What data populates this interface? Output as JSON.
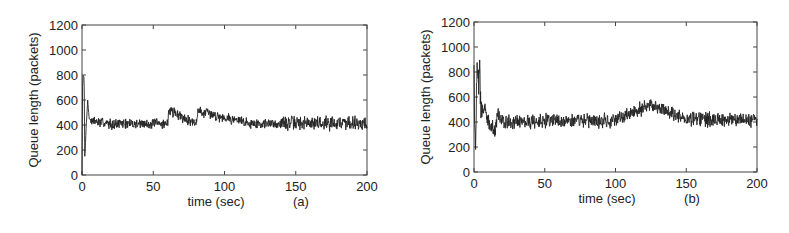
{
  "chart_data": [
    {
      "type": "line",
      "panel_label": "(a)",
      "xlabel": "time (sec)",
      "ylabel": "Queue length (packets)",
      "xlim": [
        0,
        200
      ],
      "ylim": [
        0,
        1200
      ],
      "xticks": [
        0,
        50,
        100,
        150,
        200
      ],
      "yticks": [
        0,
        200,
        400,
        600,
        800,
        1000,
        1200
      ],
      "grid": false,
      "series": [
        {
          "name": "queue length",
          "color": "#222222",
          "description": "Starts near 0, jumps to ~800 in first ~2s, drops back, secondary peak ~600 at ~4s, then settles around ~410 with noise of roughly +/-50 packets; noise amplitude grows slightly after t=140s (peaks ~500).",
          "key_points": [
            [
              0,
              0
            ],
            [
              0.5,
              800
            ],
            [
              1.5,
              780
            ],
            [
              2,
              150
            ],
            [
              3,
              400
            ],
            [
              4,
              600
            ],
            [
              5,
              450
            ],
            [
              7,
              430
            ],
            [
              20,
              410
            ],
            [
              60,
              410
            ],
            [
              61,
              520
            ],
            [
              80,
              410
            ],
            [
              81,
              510
            ],
            [
              120,
              410
            ],
            [
              150,
              415
            ],
            [
              190,
              420
            ],
            [
              200,
              410
            ]
          ],
          "steady_state_mean": 410,
          "noise_amplitude": 50
        }
      ]
    },
    {
      "type": "line",
      "panel_label": "(b)",
      "xlabel": "time (sec)",
      "ylabel": "Queue length (packets)",
      "xlim": [
        0,
        200
      ],
      "ylim": [
        0,
        1200
      ],
      "xticks": [
        0,
        50,
        100,
        150,
        200
      ],
      "yticks": [
        0,
        200,
        400,
        600,
        800,
        1000,
        1200
      ],
      "grid": false,
      "series": [
        {
          "name": "queue length",
          "color": "#222222",
          "description": "Starts at ~800, oscillates between ~100 and ~800 for the first ~5s, decays to ~400 by ~10s, then fluctuates around ~400 with noise of roughly +/-70 packets; occasional spikes to ~540 near t=125s.",
          "key_points": [
            [
              0,
              800
            ],
            [
              1,
              100
            ],
            [
              2,
              800
            ],
            [
              3,
              700
            ],
            [
              4,
              780
            ],
            [
              5,
              450
            ],
            [
              8,
              520
            ],
            [
              10,
              400
            ],
            [
              15,
              320
            ],
            [
              17,
              470
            ],
            [
              20,
              400
            ],
            [
              50,
              410
            ],
            [
              100,
              410
            ],
            [
              125,
              540
            ],
            [
              150,
              420
            ],
            [
              200,
              420
            ]
          ],
          "steady_state_mean": 405,
          "noise_amplitude": 70
        }
      ]
    }
  ],
  "layout": {
    "panels": [
      {
        "plot": {
          "x": 82,
          "y": 25,
          "w": 285,
          "h": 150
        },
        "seed": 7
      },
      {
        "plot": {
          "x": 84,
          "y": 22,
          "w": 283,
          "h": 150
        },
        "seed": 13
      }
    ]
  }
}
